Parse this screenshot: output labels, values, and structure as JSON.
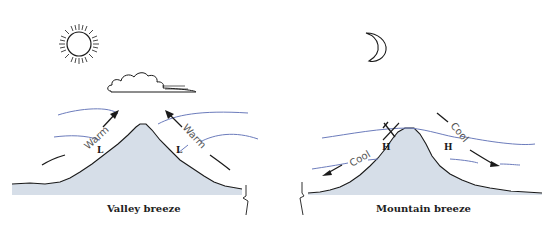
{
  "panels": [
    {
      "caption": "Valley breeze",
      "celestial": "sun-icon",
      "has_cloud": true,
      "flow_label_left": "Warm",
      "flow_label_right": "Warm",
      "pressure_left": "L",
      "pressure_right": "L",
      "flow_direction": "upslope"
    },
    {
      "caption": "Mountain breeze",
      "celestial": "moon-icon",
      "has_cloud": false,
      "flow_label_left": "Cool",
      "flow_label_right": "Cool",
      "pressure_left": "H",
      "pressure_right": "H",
      "flow_direction": "downslope"
    }
  ],
  "colors": {
    "mountain_fill": "#d6dee8",
    "isobar_lines": "#6c7cbc",
    "ink": "#1a1a1a"
  }
}
